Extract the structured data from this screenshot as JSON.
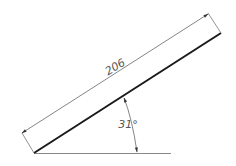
{
  "drawing": {
    "type": "inclined-line-dimension",
    "length_label": "206",
    "angle_label": "31°",
    "colors": {
      "main_line": "#1a1a1a",
      "dimension": "#666666",
      "baseline": "#888888",
      "text": "#555555"
    }
  }
}
